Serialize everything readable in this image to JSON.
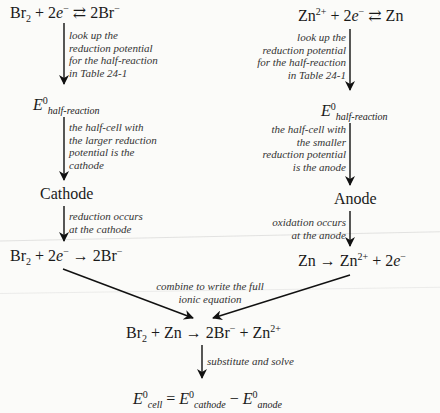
{
  "left": {
    "half_reaction": {
      "lhs_species": "Br",
      "lhs_sub": "2",
      "plus1": " + 2",
      "electron": "e",
      "electron_charge": "−",
      "arrow": " ⇄ ",
      "rhs": "2Br",
      "rhs_charge": "−"
    },
    "note1": [
      "look up the",
      "reduction potential",
      "for the half-reaction",
      "in Table 24-1"
    ],
    "potential": {
      "symbol": "E",
      "superscript": "0",
      "subscript": "half-reaction"
    },
    "note2": [
      "the half-cell with",
      "the larger reduction",
      "potential is the",
      "cathode"
    ],
    "electrode": "Cathode",
    "note3": [
      "reduction occurs",
      "at the cathode"
    ],
    "reaction": {
      "lhs_species": "Br",
      "lhs_sub": "2",
      "plus1": " + 2",
      "electron": "e",
      "electron_charge": "−",
      "arrow": " → ",
      "rhs": "2Br",
      "rhs_charge": "−"
    }
  },
  "right": {
    "half_reaction": {
      "lhs_species": "Zn",
      "lhs_charge": "2+",
      "plus1": " + 2",
      "electron": "e",
      "electron_charge": "−",
      "arrow": " ⇄ ",
      "rhs": "Zn"
    },
    "note1": [
      "look up the",
      "reduction potential",
      "for the half-reaction",
      "in Table 24-1"
    ],
    "potential": {
      "symbol": "E",
      "superscript": "0",
      "subscript": "half-reaction"
    },
    "note2": [
      "the half-cell with",
      "the smaller",
      "reduction potential",
      "is the anode"
    ],
    "electrode": "Anode",
    "note3": [
      "oxidation occurs",
      "at the anode"
    ],
    "reaction": {
      "lhs": "Zn",
      "arrow": " → ",
      "product": "Zn",
      "product_charge": "2+",
      "plus": " + 2",
      "electron": "e",
      "electron_charge": "−"
    }
  },
  "combine": {
    "note": [
      "combine to write the full",
      "ionic equation"
    ],
    "equation": {
      "a": "Br",
      "a_sub": "2",
      "plus1": " + Zn",
      "arrow": " → ",
      "b": "2Br",
      "b_charge": "−",
      "plus2": " + Zn",
      "c_charge": "2+"
    },
    "note2": "substitute and solve",
    "final": {
      "lhs_symbol": "E",
      "lhs_sup": "0",
      "lhs_sub": "cell",
      "eq": " = ",
      "t1_symbol": "E",
      "t1_sup": "0",
      "t1_sub": "cathode",
      "minus": " − ",
      "t2_symbol": "E",
      "t2_sup": "0",
      "t2_sub": "anode"
    }
  }
}
